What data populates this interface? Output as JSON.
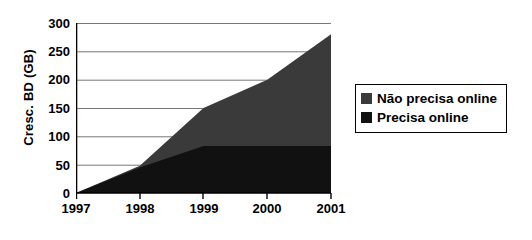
{
  "chart_data": {
    "type": "area",
    "stacked": true,
    "title": "",
    "xlabel": "",
    "ylabel": "Cresc. BD (GB)",
    "categories": [
      "1997",
      "1998",
      "1999",
      "2000",
      "2001"
    ],
    "x_tick_labels": [
      "1997",
      "1998",
      "1999",
      "2000",
      "2001"
    ],
    "y_tick_labels": [
      "0",
      "50",
      "100",
      "150",
      "200",
      "250",
      "300"
    ],
    "y_ticks": [
      0,
      50,
      100,
      150,
      200,
      250,
      300
    ],
    "ylim": [
      0,
      300
    ],
    "grid": "horizontal",
    "legend_position": "right",
    "series": [
      {
        "name": "Não precisa online",
        "color": "#3a3a3a",
        "values": [
          0,
          3,
          67,
          117,
          197
        ]
      },
      {
        "name": "Precisa online",
        "color": "#111111",
        "values": [
          0,
          45,
          83,
          83,
          83
        ]
      }
    ],
    "cumulative_totals": [
      0,
      48,
      150,
      200,
      280
    ],
    "annotations": []
  },
  "legend": {
    "items": [
      {
        "label": "Não precisa online",
        "marker": "square-marker",
        "color": "#3a3a3a"
      },
      {
        "label": "Precisa online",
        "marker": "square-marker",
        "color": "#111111"
      }
    ]
  },
  "axes": {
    "y_title": "Cresc. BD (GB)",
    "y_ticks": [
      "300",
      "250",
      "200",
      "150",
      "100",
      "50",
      "0"
    ],
    "x_ticks": [
      "1997",
      "1998",
      "1999",
      "2000",
      "2001"
    ]
  },
  "colors": {
    "upper_band": "#3a3a3a",
    "lower_band": "#111111",
    "axis": "#000000",
    "gridline": "#777777",
    "background": "#ffffff"
  }
}
